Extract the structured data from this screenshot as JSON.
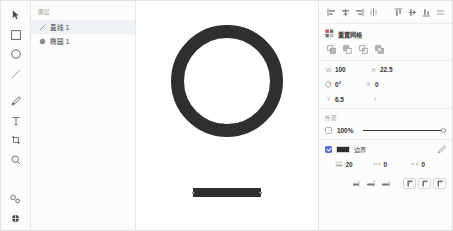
{
  "toolbar": {
    "tools": [
      {
        "name": "select-tool",
        "label": "选择",
        "icon": "cursor-arrow-icon"
      },
      {
        "name": "rectangle-tool",
        "label": "矩形",
        "icon": "square-icon"
      },
      {
        "name": "ellipse-tool",
        "label": "椭圆",
        "icon": "circle-icon"
      },
      {
        "name": "line-tool",
        "label": "直线",
        "icon": "line-icon"
      },
      {
        "name": "pen-tool",
        "label": "钢笔",
        "icon": "pen-icon"
      },
      {
        "name": "text-tool",
        "label": "文字",
        "icon": "text-t-icon"
      },
      {
        "name": "crop-tool",
        "label": "裁剪",
        "icon": "crop-icon"
      },
      {
        "name": "zoom-tool",
        "label": "缩放",
        "icon": "magnifier-icon"
      },
      {
        "name": "link-tool",
        "label": "链接",
        "icon": "link-chain-icon"
      },
      {
        "name": "settings-tool",
        "label": "设置",
        "icon": "gear-sphere-icon"
      }
    ]
  },
  "layers": {
    "title": "图层",
    "items": [
      {
        "name": "直线 1",
        "icon": "line-icon",
        "selected": true
      },
      {
        "name": "椭圆 1",
        "icon": "circle-icon",
        "selected": false
      }
    ]
  },
  "canvas": {
    "shapes": [
      {
        "type": "ring",
        "name": "椭圆 1",
        "stroke_color": "#2f2f2f",
        "stroke_width": 13
      },
      {
        "type": "line",
        "name": "直线 1",
        "stroke_color": "#2f2f2f",
        "stroke_width": 9,
        "selected": true
      }
    ]
  },
  "inspector": {
    "align": {
      "horizontal": [
        {
          "name": "align-left-button",
          "label": "左对齐",
          "icon": "align-left-icon"
        },
        {
          "name": "align-center-h-button",
          "label": "水平居中",
          "icon": "align-center-h-icon"
        },
        {
          "name": "align-right-button",
          "label": "右对齐",
          "icon": "align-right-icon"
        },
        {
          "name": "distribute-h-button",
          "label": "水平分布",
          "icon": "distribute-h-icon"
        }
      ],
      "vertical": [
        {
          "name": "align-top-button",
          "label": "顶对齐",
          "icon": "align-top-icon"
        },
        {
          "name": "align-middle-button",
          "label": "垂直居中",
          "icon": "align-middle-icon"
        },
        {
          "name": "align-bottom-button",
          "label": "底对齐",
          "icon": "align-bottom-icon"
        },
        {
          "name": "distribute-v-button",
          "label": "垂直分布",
          "icon": "distribute-v-icon"
        }
      ]
    },
    "grid": {
      "label": "重置网格",
      "icon": "grid-icon",
      "boolean_ops": [
        {
          "name": "boolean-union-button",
          "label": "联集",
          "icon": "union-icon"
        },
        {
          "name": "boolean-subtract-button",
          "label": "差集",
          "icon": "subtract-icon"
        },
        {
          "name": "boolean-intersect-button",
          "label": "交集",
          "icon": "intersect-icon"
        },
        {
          "name": "boolean-exclude-button",
          "label": "排除",
          "icon": "exclude-icon"
        }
      ]
    },
    "transform": {
      "width": {
        "label": "W",
        "value": "100"
      },
      "height": {
        "label": "H",
        "value": "22.5"
      },
      "x": {
        "label": "X",
        "value": "0"
      },
      "y": {
        "label": "Y",
        "value": "6.5"
      },
      "rotation": {
        "icon": "rotate-icon",
        "value": "0°"
      },
      "link_icon": "link-constrain-icon"
    },
    "appearance": {
      "title": "外观",
      "opacity": {
        "checkbox_checked": false,
        "value": "100%",
        "slider_percent": 100
      }
    },
    "stroke": {
      "checkbox_checked": true,
      "color": "#2f2f2f",
      "label": "边界",
      "eyedropper_icon": "eyedropper-icon",
      "fields": [
        {
          "name": "stroke-width-field",
          "icon": "stroke-width-icon",
          "value": "20"
        },
        {
          "name": "stroke-dash-field",
          "icon": "dash-icon",
          "value": "0"
        },
        {
          "name": "stroke-gap-field",
          "icon": "gap-icon",
          "value": "0"
        }
      ],
      "caps": [
        {
          "name": "cap-butt-button",
          "label": "平头",
          "icon": "cap-butt-icon"
        },
        {
          "name": "cap-round-button",
          "label": "圆头",
          "icon": "cap-round-icon"
        },
        {
          "name": "cap-square-button",
          "label": "方头",
          "icon": "cap-square-icon"
        }
      ],
      "joins": [
        {
          "name": "join-miter-button",
          "label": "尖角",
          "icon": "join-miter-icon"
        },
        {
          "name": "join-round-button",
          "label": "圆角",
          "icon": "join-round-icon"
        },
        {
          "name": "join-bevel-button",
          "label": "斜角",
          "icon": "join-bevel-icon"
        }
      ]
    }
  }
}
